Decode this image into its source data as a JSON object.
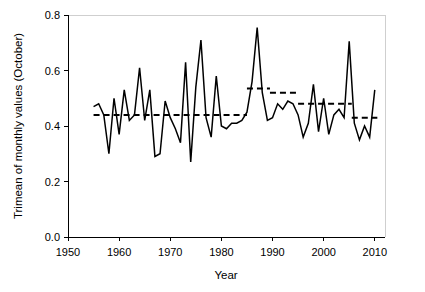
{
  "chart_data": {
    "type": "line",
    "title": "",
    "xlabel": "Year",
    "ylabel": "Trimean of monthly values (October)",
    "xlim": [
      1950,
      2012
    ],
    "ylim": [
      0.0,
      0.8
    ],
    "xticks": [
      1950,
      1960,
      1970,
      1980,
      1990,
      2000,
      2010
    ],
    "xtick_labels": [
      "1950",
      "1960",
      "1970",
      "1980",
      "1990",
      "2000",
      "2010"
    ],
    "yticks": [
      0.0,
      0.2,
      0.4,
      0.6,
      0.8
    ],
    "ytick_labels": [
      "0.0",
      "0.2",
      "0.4",
      "0.6",
      "0.8"
    ],
    "grid": false,
    "legend": "none",
    "line_color": "#000000",
    "mean_line_color": "#000000",
    "background_color": "#ffffff",
    "x": [
      1955,
      1956,
      1957,
      1958,
      1959,
      1960,
      1961,
      1962,
      1963,
      1964,
      1965,
      1966,
      1967,
      1968,
      1969,
      1970,
      1971,
      1972,
      1973,
      1974,
      1975,
      1976,
      1977,
      1978,
      1979,
      1980,
      1981,
      1982,
      1983,
      1984,
      1985,
      1986,
      1987,
      1988,
      1989,
      1990,
      1991,
      1992,
      1993,
      1994,
      1995,
      1996,
      1997,
      1998,
      1999,
      2000,
      2001,
      2002,
      2003,
      2004,
      2005,
      2006,
      2007,
      2008,
      2009,
      2010
    ],
    "values": [
      0.47,
      0.48,
      0.44,
      0.3,
      0.5,
      0.37,
      0.53,
      0.42,
      0.44,
      0.61,
      0.42,
      0.53,
      0.29,
      0.3,
      0.49,
      0.43,
      0.39,
      0.34,
      0.63,
      0.27,
      0.54,
      0.71,
      0.43,
      0.36,
      0.58,
      0.4,
      0.39,
      0.41,
      0.41,
      0.42,
      0.45,
      0.56,
      0.755,
      0.52,
      0.42,
      0.43,
      0.48,
      0.46,
      0.49,
      0.48,
      0.44,
      0.36,
      0.41,
      0.55,
      0.38,
      0.5,
      0.37,
      0.44,
      0.46,
      0.43,
      0.705,
      0.41,
      0.35,
      0.4,
      0.36,
      0.53
    ],
    "series": [
      {
        "name": "Trimean of monthly values (October)",
        "style": "solid",
        "values": [
          0.47,
          0.48,
          0.44,
          0.3,
          0.5,
          0.37,
          0.53,
          0.42,
          0.44,
          0.61,
          0.42,
          0.53,
          0.29,
          0.3,
          0.49,
          0.43,
          0.39,
          0.34,
          0.63,
          0.27,
          0.54,
          0.71,
          0.43,
          0.36,
          0.58,
          0.4,
          0.39,
          0.41,
          0.41,
          0.42,
          0.45,
          0.56,
          0.755,
          0.52,
          0.42,
          0.43,
          0.48,
          0.46,
          0.49,
          0.48,
          0.44,
          0.36,
          0.41,
          0.55,
          0.38,
          0.5,
          0.37,
          0.44,
          0.46,
          0.43,
          0.705,
          0.41,
          0.35,
          0.4,
          0.36,
          0.53
        ]
      }
    ],
    "mean_segments": [
      {
        "x_start": 1955.0,
        "x_end": 1985.0,
        "value": 0.44
      },
      {
        "x_start": 1985.0,
        "x_end": 1989.5,
        "value": 0.535
      },
      {
        "x_start": 1989.5,
        "x_end": 1995.0,
        "value": 0.52
      },
      {
        "x_start": 1995.0,
        "x_end": 2005.5,
        "value": 0.48
      },
      {
        "x_start": 2005.5,
        "x_end": 2010.5,
        "value": 0.43
      }
    ],
    "annotations": [
      {
        "label": "maximum",
        "x": 1987,
        "y": 0.755
      },
      {
        "label": "minimum",
        "x": 1974,
        "y": 0.27
      }
    ]
  },
  "axes": {
    "y_title": "Trimean of monthly values (October)",
    "x_title": "Year"
  }
}
